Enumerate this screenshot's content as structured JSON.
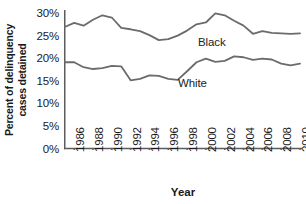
{
  "chart_data": {
    "type": "line",
    "title": "",
    "xlabel": "Year",
    "ylabel": "Percent of delinquency cases detained",
    "ylabel_line1": "Percent of delinquency",
    "ylabel_line2": "cases detained",
    "xlim": [
      1985,
      2010
    ],
    "ylim": [
      0,
      30
    ],
    "grid": false,
    "legend_position": "inline-annotation",
    "y_ticks": [
      0,
      5,
      10,
      15,
      20,
      25,
      30
    ],
    "y_tick_labels": [
      "0%",
      "5%",
      "10%",
      "15%",
      "20%",
      "25%",
      "30%"
    ],
    "x_ticks": [
      1986,
      1988,
      1990,
      1992,
      1994,
      1996,
      1998,
      2000,
      2002,
      2004,
      2006,
      2008,
      2010
    ],
    "x_tick_labels": [
      "1986",
      "1988",
      "1990",
      "1992",
      "1994",
      "1996",
      "1998",
      "2000",
      "2002",
      "2004",
      "2006",
      "2008",
      "2010"
    ],
    "x": [
      1985,
      1986,
      1987,
      1988,
      1989,
      1990,
      1991,
      1992,
      1993,
      1994,
      1995,
      1996,
      1997,
      1998,
      1999,
      2000,
      2001,
      2002,
      2003,
      2004,
      2005,
      2006,
      2007,
      2008,
      2009,
      2010
    ],
    "series": [
      {
        "name": "Black",
        "color": "#6b6b6b",
        "values": [
          26.9,
          27.8,
          27.2,
          28.5,
          29.5,
          29.0,
          26.7,
          26.4,
          26.0,
          25.1,
          24.0,
          24.2,
          25.0,
          26.1,
          27.5,
          27.9,
          29.9,
          29.5,
          28.3,
          27.2,
          25.4,
          26.0,
          25.6,
          25.5,
          25.4,
          25.5
        ]
      },
      {
        "name": "White",
        "color": "#6b6b6b",
        "values": [
          19.1,
          19.1,
          18.0,
          17.6,
          17.8,
          18.3,
          18.2,
          15.1,
          15.4,
          16.2,
          16.1,
          15.4,
          15.2,
          17.1,
          19.1,
          19.9,
          19.2,
          19.4,
          20.4,
          20.2,
          19.6,
          19.9,
          19.7,
          18.8,
          18.4,
          18.8
        ]
      }
    ],
    "annotations": [
      {
        "text": "Black",
        "series": "Black"
      },
      {
        "text": "White",
        "series": "White"
      }
    ]
  }
}
